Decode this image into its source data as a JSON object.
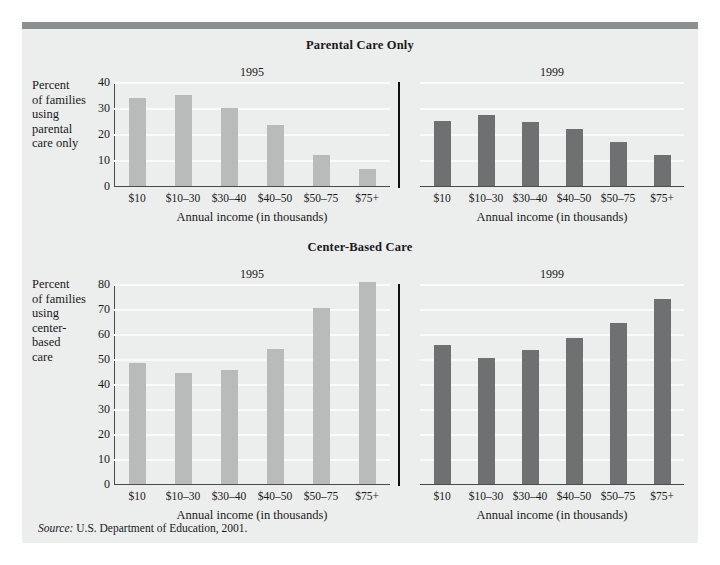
{
  "figure": {
    "source_prefix": "Source:",
    "source_text": " U.S. Department of Education, 2001.",
    "accent_color": "#8c8f91",
    "card_background": "#eceded",
    "bar_color_1995": "#b9bbbb",
    "bar_color_1999": "#6e7071"
  },
  "chart_data": [
    {
      "type": "bar",
      "title": "Parental Care Only",
      "xlabel": "Annual income (in thousands)",
      "ylabel": "Percent of families using parental care only",
      "ylim": [
        0,
        40
      ],
      "yticks": [
        0,
        10,
        20,
        30,
        40
      ],
      "grid": true,
      "legend": "none",
      "categories": [
        "$10",
        "$10–30",
        "$30–40",
        "$40–50",
        "$50–75",
        "$75+"
      ],
      "series": [
        {
          "name": "1995",
          "color": "#b9bbbb",
          "values": [
            34,
            35,
            30,
            23.5,
            12,
            6.5
          ]
        },
        {
          "name": "1999",
          "color": "#6e7071",
          "values": [
            25,
            27.5,
            24.5,
            22,
            17,
            12
          ]
        }
      ]
    },
    {
      "type": "bar",
      "title": "Center-Based Care",
      "xlabel": "Annual income (in thousands)",
      "ylabel": "Percent of families using center-based care",
      "ylim": [
        0,
        80
      ],
      "yticks": [
        0,
        10,
        20,
        30,
        40,
        50,
        60,
        70,
        80
      ],
      "grid": true,
      "legend": "none",
      "categories": [
        "$10",
        "$10–30",
        "$30–40",
        "$40–50",
        "$50–75",
        "$75+"
      ],
      "series": [
        {
          "name": "1995",
          "color": "#b9bbbb",
          "values": [
            48.5,
            44.5,
            45.5,
            54,
            70.5,
            81
          ]
        },
        {
          "name": "1999",
          "color": "#6e7071",
          "values": [
            55.5,
            50.5,
            53.5,
            58.5,
            64.5,
            74
          ]
        }
      ]
    }
  ],
  "top_chart": {
    "title": "Parental Care Only",
    "ylabel_lines": [
      "Percent",
      "of families",
      "using",
      "parental",
      "care only"
    ],
    "xaxis_title_left": "Annual income (in thousands)",
    "xaxis_title_right": "Annual income (in thousands)",
    "year_left": "1995",
    "year_right": "1999"
  },
  "bottom_chart": {
    "title": "Center-Based Care",
    "ylabel_lines": [
      "Percent",
      "of families",
      "using",
      "center-",
      "based",
      "care"
    ],
    "xaxis_title_left": "Annual income (in thousands)",
    "xaxis_title_right": "Annual income (in thousands)",
    "year_left": "1995",
    "year_right": "1999"
  }
}
